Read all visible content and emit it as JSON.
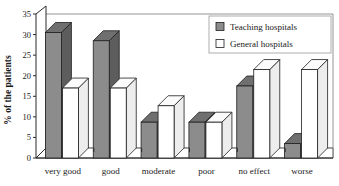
{
  "chart_data": {
    "type": "bar",
    "title": "",
    "xlabel": "",
    "ylabel": "% of the patients",
    "ylim": [
      0,
      35
    ],
    "yticks": [
      0,
      5,
      10,
      15,
      20,
      25,
      30,
      35
    ],
    "ytick_labels": [
      "0",
      "5",
      "10",
      "15",
      "20",
      "25",
      "30",
      "35"
    ],
    "grid": false,
    "legend_position": "top-right",
    "style": "3d-bar",
    "categories": [
      "very good",
      "good",
      "moderate",
      "poor",
      "no effect",
      "worse"
    ],
    "series": [
      {
        "name": "Teaching hospitals",
        "color": "#8c8c8c",
        "values": [
          30.5,
          28.5,
          8.7,
          8.7,
          17.5,
          3.5
        ]
      },
      {
        "name": "General hospitals",
        "color": "#ffffff",
        "values": [
          17.0,
          17.0,
          12.7,
          8.7,
          21.5,
          21.5
        ]
      }
    ]
  },
  "legend": {
    "entries": [
      {
        "label": "Teaching hospitals",
        "swatch": "filled-gray-square-icon"
      },
      {
        "label": "General hospitals",
        "swatch": "empty-white-square-icon"
      }
    ]
  }
}
